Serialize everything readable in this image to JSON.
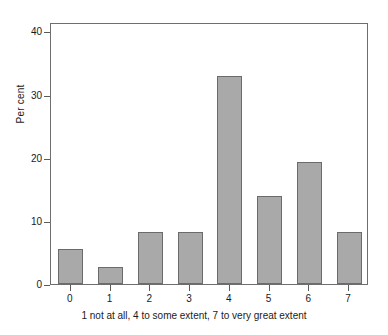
{
  "chart_data": {
    "type": "bar",
    "title": "",
    "subtitle": "",
    "categories": [
      "0",
      "1",
      "2",
      "3",
      "4",
      "5",
      "6",
      "7"
    ],
    "values": [
      5.5,
      2.7,
      8.3,
      8.3,
      32.9,
      13.9,
      19.3,
      8.3
    ],
    "xlabel": "1 not at all, 4 to some extent, 7 to very great extent",
    "ylabel": "Per cent",
    "ylim": [
      0,
      41.5
    ],
    "yticks": [
      0,
      10,
      20,
      30,
      40
    ],
    "ytick_labels": [
      "0",
      "10",
      "20",
      "30",
      "40"
    ],
    "grid": false,
    "legend": null,
    "bar_color": "#a9a9a9",
    "bar_edge_color": "#6b6b6b",
    "frame_color": "#6e6e6e",
    "background": "#ffffff"
  }
}
